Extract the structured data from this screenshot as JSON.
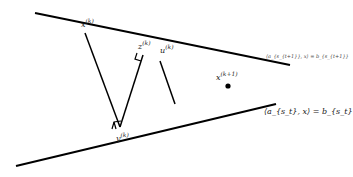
{
  "diagram": {
    "type": "geometric-projection",
    "stroke_color": "#000000",
    "background": "#ffffff",
    "lines": {
      "upper_hyperplane": {
        "x1": 35,
        "y1": 13,
        "x2": 290,
        "y2": 65
      },
      "lower_hyperplane": {
        "x1": 16,
        "y1": 166,
        "x2": 276,
        "y2": 104
      }
    },
    "labels": {
      "x_k": {
        "base": "x",
        "sup": "(k)"
      },
      "z_k": {
        "base": "z",
        "sup": "(k)"
      },
      "u_k": {
        "base": "u",
        "sup": "(k)"
      },
      "y_k": {
        "base": "y",
        "sup": "(k)"
      },
      "x_k1": {
        "base": "x",
        "sup": "(k+1)"
      },
      "upper_eq": "⟨a_{s_{t+1}}, x⟩ = b_{s_{t+1}}",
      "lower_eq": "⟨a_{s_t}, x⟩ = b_{s_t}"
    },
    "points": {
      "x_k": [
        85,
        33
      ],
      "z_k": [
        143,
        55
      ],
      "u_k": [
        160,
        61
      ],
      "y_k": [
        120,
        127
      ],
      "u_proj": [
        175,
        104
      ],
      "x_k1": [
        228,
        86
      ]
    }
  }
}
